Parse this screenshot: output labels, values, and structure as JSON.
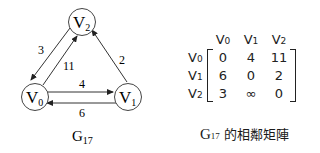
{
  "graph": {
    "name": "G17",
    "caption_main": "G",
    "caption_sub": "17",
    "nodes": [
      {
        "id": "V0",
        "label_main": "V",
        "label_sub": "0"
      },
      {
        "id": "V1",
        "label_main": "V",
        "label_sub": "1"
      },
      {
        "id": "V2",
        "label_main": "V",
        "label_sub": "2"
      }
    ],
    "edges": [
      {
        "from": "V0",
        "to": "V1",
        "weight": "4"
      },
      {
        "from": "V1",
        "to": "V0",
        "weight": "6"
      },
      {
        "from": "V0",
        "to": "V2",
        "weight": "11"
      },
      {
        "from": "V2",
        "to": "V0",
        "weight": "3"
      },
      {
        "from": "V1",
        "to": "V2",
        "weight": "2"
      }
    ]
  },
  "matrix": {
    "col_headers": [
      {
        "main": "V",
        "sub": "0"
      },
      {
        "main": "V",
        "sub": "1"
      },
      {
        "main": "V",
        "sub": "2"
      }
    ],
    "row_headers": [
      {
        "main": "V",
        "sub": "0"
      },
      {
        "main": "V",
        "sub": "1"
      },
      {
        "main": "V",
        "sub": "2"
      }
    ],
    "rows": [
      [
        "0",
        "4",
        "11"
      ],
      [
        "6",
        "0",
        "2"
      ],
      [
        "3",
        "∞",
        "0"
      ]
    ],
    "caption_main": "G",
    "caption_sub": "17",
    "caption_text": " 的相鄰矩陣"
  }
}
